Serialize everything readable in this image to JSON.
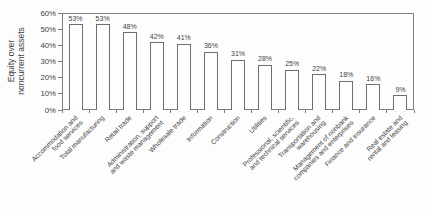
{
  "chart_data": {
    "type": "bar",
    "title": "",
    "xlabel": "",
    "ylabel": "Equity over\nnoncurrent assets",
    "categories": [
      "Accommodation and\nfood services",
      "Total manufacturing",
      "Retail trade",
      "Administration, support\nand waste management",
      "Wholesale trade",
      "Information",
      "Construction",
      "Utilities",
      "Professional, scientific,\nand technical services",
      "Transportation and\nwarehousing",
      "Management of nonbank\ncompanies and enterprises",
      "Finance and insurance",
      "Real estate and\nrental and leasing"
    ],
    "values": [
      53,
      53,
      48,
      42,
      41,
      36,
      31,
      28,
      25,
      22,
      18,
      16,
      9
    ],
    "value_labels": [
      "53%",
      "53%",
      "48%",
      "42%",
      "41%",
      "36%",
      "31%",
      "28%",
      "25%",
      "22%",
      "18%",
      "16%",
      "9%"
    ],
    "yticks": [
      "0%",
      "10%",
      "20%",
      "30%",
      "40%",
      "50%",
      "60%"
    ],
    "ytick_values": [
      0,
      10,
      20,
      30,
      40,
      50,
      60
    ],
    "ylim": [
      0,
      60
    ],
    "grid": false,
    "legend": "none",
    "colors": {
      "background": "#fdfdfd",
      "axis": "#7d7d7d",
      "bar_fill": "#ffffff",
      "bar_outline": "#6e6e6e",
      "text": "#3f3f3f"
    }
  }
}
